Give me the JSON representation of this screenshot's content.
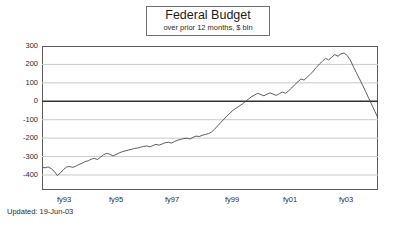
{
  "title": {
    "main": "Federal Budget",
    "sub": "over prior 12 months, $ bln"
  },
  "footer": {
    "updated": "Updated:  19-Jun-03"
  },
  "axes": {
    "y_ticks": [
      "300",
      "200",
      "100",
      "0",
      "-100",
      "-200",
      "-300",
      "-400"
    ],
    "x_ticks": [
      "fy93",
      "fy95",
      "fy97",
      "fy99",
      "fy01",
      "fy03"
    ]
  },
  "colors": {
    "line": "#4a4a4a",
    "grid": "#c9c9c9",
    "zero_line": "#333333",
    "frame": "#5c5c5c",
    "background": "#ffffff",
    "text": "#2b2b2b"
  },
  "chart_data": {
    "type": "line",
    "title": "Federal Budget",
    "subtitle": "over prior 12 months, $ bln",
    "xlabel": "",
    "ylabel": "$ bln",
    "ylim": [
      -400,
      300
    ],
    "yticks": [
      300,
      200,
      100,
      0,
      -100,
      -200,
      -300,
      -400
    ],
    "xlim": [
      "fy92.6",
      "fy03.5"
    ],
    "xticks": [
      "fy93",
      "fy95",
      "fy97",
      "fy99",
      "fy01",
      "fy03"
    ],
    "grid": "horizontal",
    "legend": "none",
    "series": [
      {
        "name": "Federal Budget Balance (trailing 12 months)",
        "x": [
          "fy92.6",
          "fy92.7",
          "fy92.8",
          "fy92.9",
          "fy93.0",
          "fy93.1",
          "fy93.2",
          "fy93.3",
          "fy93.4",
          "fy93.5",
          "fy93.6",
          "fy93.7",
          "fy93.8",
          "fy93.9",
          "fy94.0",
          "fy94.1",
          "fy94.2",
          "fy94.3",
          "fy94.4",
          "fy94.5",
          "fy94.6",
          "fy94.7",
          "fy94.8",
          "fy94.9",
          "fy95.0",
          "fy95.1",
          "fy95.2",
          "fy95.3",
          "fy95.4",
          "fy95.5",
          "fy95.6",
          "fy95.7",
          "fy95.8",
          "fy95.9",
          "fy96.0",
          "fy96.1",
          "fy96.2",
          "fy96.3",
          "fy96.4",
          "fy96.5",
          "fy96.6",
          "fy96.7",
          "fy96.8",
          "fy96.9",
          "fy97.0",
          "fy97.1",
          "fy97.2",
          "fy97.3",
          "fy97.4",
          "fy97.5",
          "fy97.6",
          "fy97.7",
          "fy97.8",
          "fy97.9",
          "fy98.0",
          "fy98.1",
          "fy98.2",
          "fy98.3",
          "fy98.4",
          "fy98.5",
          "fy98.6",
          "fy98.7",
          "fy98.8",
          "fy98.9",
          "fy99.0",
          "fy99.1",
          "fy99.2",
          "fy99.3",
          "fy99.4",
          "fy99.5",
          "fy99.6",
          "fy99.7",
          "fy99.8",
          "fy99.9",
          "fy00.0",
          "fy00.1",
          "fy00.2",
          "fy00.3",
          "fy00.4",
          "fy00.5",
          "fy00.6",
          "fy00.7",
          "fy00.8",
          "fy00.9",
          "fy01.0",
          "fy01.1",
          "fy01.2",
          "fy01.3",
          "fy01.4",
          "fy01.5",
          "fy01.6",
          "fy01.7",
          "fy01.8",
          "fy01.9",
          "fy02.0",
          "fy02.1",
          "fy02.2",
          "fy02.3",
          "fy02.4",
          "fy02.5",
          "fy02.6",
          "fy02.7",
          "fy02.8",
          "fy02.9",
          "fy03.0",
          "fy03.1",
          "fy03.2",
          "fy03.3",
          "fy03.4",
          "fy03.5"
        ],
        "values": [
          -290,
          -292,
          -288,
          -296,
          -310,
          -330,
          -316,
          -300,
          -288,
          -286,
          -290,
          -284,
          -276,
          -270,
          -262,
          -258,
          -250,
          -246,
          -252,
          -240,
          -228,
          -222,
          -226,
          -234,
          -228,
          -220,
          -214,
          -210,
          -206,
          -202,
          -198,
          -196,
          -192,
          -188,
          -186,
          -190,
          -184,
          -178,
          -182,
          -176,
          -170,
          -168,
          -172,
          -164,
          -158,
          -154,
          -150,
          -148,
          -152,
          -144,
          -138,
          -140,
          -134,
          -130,
          -126,
          -118,
          -104,
          -88,
          -72,
          -56,
          -40,
          -26,
          -12,
          -2,
          8,
          18,
          30,
          42,
          54,
          62,
          70,
          64,
          58,
          66,
          72,
          66,
          60,
          68,
          76,
          70,
          82,
          96,
          112,
          126,
          140,
          134,
          148,
          162,
          178,
          196,
          212,
          226,
          240,
          232,
          246,
          258,
          250,
          262,
          266,
          254,
          232,
          200,
          170,
          140,
          110,
          78,
          46,
          14,
          -18,
          -50
        ]
      }
    ],
    "annotations": [
      {
        "text": "Updated:  19-Jun-03",
        "position": "below-axis-left"
      }
    ]
  }
}
